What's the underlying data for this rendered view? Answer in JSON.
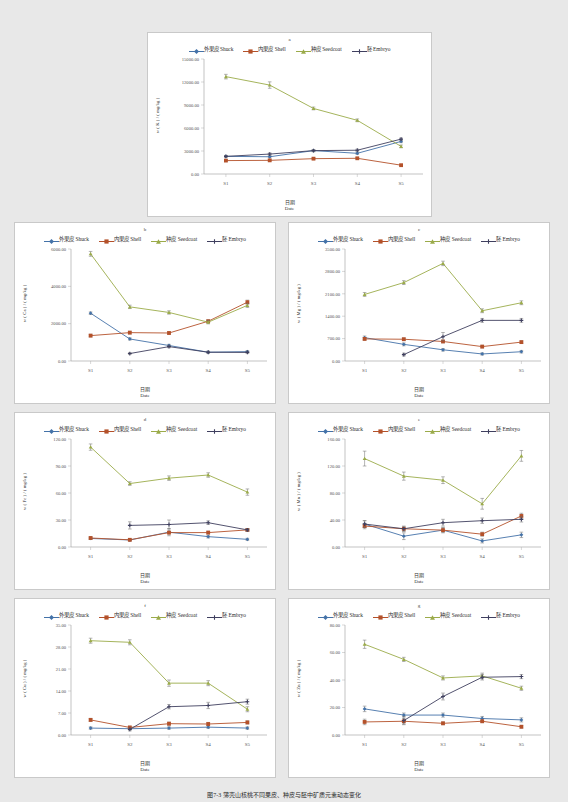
{
  "figure": {
    "caption": "图7-3  薄壳山核桃不同果皮、种皮与胚中矿质元素动态变化",
    "series_names": [
      "外果皮 Shuck",
      "内果皮 Shell",
      "种皮 Seedcoat",
      "胚 Embryo"
    ],
    "series_colors": [
      "#4472a8",
      "#b4512a",
      "#9bab4a",
      "#3f3f5f"
    ],
    "xlabel_cn": "日期",
    "xlabel_en": "Date",
    "categories": [
      "S1",
      "S2",
      "S3",
      "S4",
      "S5"
    ]
  },
  "chart_data": [
    {
      "id": "a",
      "panel": "a",
      "type": "line",
      "title": "a",
      "element": "K",
      "ylabel": "w ( K ) / ( mg/kg )",
      "xlabel": "日期 Date",
      "categories": [
        "S1",
        "S2",
        "S3",
        "S4",
        "S5"
      ],
      "ylim": [
        0,
        15000
      ],
      "yticks": [
        "0.00",
        "3000.00",
        "6000.00",
        "9000.00",
        "12000.00",
        "15000.00"
      ],
      "grid": false,
      "legend": "top",
      "series": [
        {
          "name": "外果皮 Shuck",
          "values": [
            2300,
            2250,
            3050,
            2700,
            4250
          ],
          "err": [
            120,
            130,
            140,
            150,
            160
          ]
        },
        {
          "name": "内果皮 Shell",
          "values": [
            1750,
            1780,
            2000,
            2050,
            1150
          ],
          "err": [
            90,
            90,
            90,
            90,
            90
          ]
        },
        {
          "name": "种皮 Seedcoat",
          "values": [
            12700,
            11600,
            8550,
            7000,
            3600
          ],
          "err": [
            300,
            420,
            180,
            180,
            180
          ]
        },
        {
          "name": "胚 Embryo",
          "values": [
            2300,
            2600,
            3050,
            3100,
            4550
          ],
          "err": [
            110,
            150,
            130,
            140,
            150
          ]
        }
      ]
    },
    {
      "id": "b",
      "panel": "b",
      "type": "line",
      "title": "b",
      "element": "Ca",
      "ylabel": "w ( Ca ) / ( mg/kg )",
      "xlabel": "日期 Date",
      "categories": [
        "S1",
        "S2",
        "S3",
        "S4",
        "S5"
      ],
      "ylim": [
        0,
        6000
      ],
      "yticks": [
        "0.00",
        "2000.00",
        "4000.00",
        "6000.00"
      ],
      "grid": false,
      "legend": "top",
      "series": [
        {
          "name": "外果皮 Shuck",
          "values": [
            2560,
            1180,
            830,
            470,
            500
          ],
          "err": [
            70,
            60,
            60,
            50,
            50
          ]
        },
        {
          "name": "内果皮 Shell",
          "values": [
            1360,
            1520,
            1500,
            2130,
            3150
          ],
          "err": [
            70,
            70,
            70,
            80,
            110
          ]
        },
        {
          "name": "种皮 Seedcoat",
          "values": [
            5740,
            2900,
            2600,
            2080,
            2980
          ],
          "err": [
            130,
            90,
            90,
            90,
            110
          ]
        },
        {
          "name": "胚 Embryo",
          "values": [
            null,
            400,
            770,
            470,
            460
          ],
          "err": [
            0,
            50,
            60,
            50,
            60
          ]
        }
      ]
    },
    {
      "id": "c",
      "panel": "c",
      "type": "line",
      "title": "c",
      "element": "Mg",
      "ylabel": "w ( Mg ) / ( mg/kg )",
      "xlabel": "日期 Date",
      "categories": [
        "S1",
        "S2",
        "S3",
        "S4",
        "S5"
      ],
      "ylim": [
        0,
        3500
      ],
      "yticks": [
        "0.00",
        "700.00",
        "1400.00",
        "2100.00",
        "2800.00",
        "3500.00"
      ],
      "grid": false,
      "legend": "top",
      "series": [
        {
          "name": "外果皮 Shuck",
          "values": [
            730,
            520,
            350,
            220,
            290
          ],
          "err": [
            50,
            45,
            40,
            35,
            40
          ]
        },
        {
          "name": "内果皮 Shell",
          "values": [
            690,
            680,
            610,
            450,
            590
          ],
          "err": [
            40,
            40,
            40,
            40,
            40
          ]
        },
        {
          "name": "种皮 Seedcoat",
          "values": [
            2080,
            2450,
            3050,
            1570,
            1820
          ],
          "err": [
            60,
            60,
            70,
            60,
            60
          ]
        },
        {
          "name": "胚 Embryo",
          "values": [
            null,
            200,
            760,
            1270,
            1270
          ],
          "err": [
            0,
            45,
            130,
            60,
            60
          ]
        }
      ]
    },
    {
      "id": "d",
      "panel": "d",
      "type": "line",
      "title": "d",
      "element": "Fe",
      "ylabel": "w ( Fe ) / ( mg/kg )",
      "xlabel": "日期 Date",
      "categories": [
        "S1",
        "S2",
        "S3",
        "S4",
        "S5"
      ],
      "ylim": [
        0,
        120
      ],
      "yticks": [
        "0.00",
        "30.00",
        "60.00",
        "90.00",
        "120.00"
      ],
      "grid": false,
      "legend": "top",
      "series": [
        {
          "name": "外果皮 Shuck",
          "values": [
            9.5,
            7.8,
            16.5,
            11.5,
            8.5
          ],
          "err": [
            1.2,
            1.0,
            4.0,
            1.5,
            1.2
          ]
        },
        {
          "name": "内果皮 Shell",
          "values": [
            10.0,
            8.0,
            16.0,
            16.0,
            19.0
          ],
          "err": [
            1.2,
            1.0,
            1.5,
            1.5,
            1.5
          ]
        },
        {
          "name": "种皮 Seedcoat",
          "values": [
            111,
            70.5,
            76.5,
            80.0,
            61.0
          ],
          "err": [
            3.5,
            2.0,
            2.5,
            2.5,
            3.5
          ]
        },
        {
          "name": "胚 Embryo",
          "values": [
            null,
            24.0,
            25.0,
            27.0,
            19.0
          ],
          "err": [
            0,
            4.0,
            5.0,
            2.0,
            1.5
          ]
        }
      ]
    },
    {
      "id": "e",
      "panel": "e",
      "type": "line",
      "title": "e",
      "element": "Mn",
      "ylabel": "w ( Mn ) / ( mg/kg )",
      "xlabel": "日期 Date",
      "categories": [
        "S1",
        "S2",
        "S3",
        "S4",
        "S5"
      ],
      "ylim": [
        0,
        160
      ],
      "yticks": [
        "0.00",
        "40.00",
        "80.00",
        "120.00",
        "160.00"
      ],
      "grid": false,
      "legend": "top",
      "series": [
        {
          "name": "外果皮 Shuck",
          "values": [
            34.0,
            16.0,
            25.0,
            9.0,
            18.0
          ],
          "err": [
            5.0,
            5.0,
            4.0,
            3.0,
            4.0
          ]
        },
        {
          "name": "内果皮 Shell",
          "values": [
            31.0,
            27.0,
            25.0,
            19.0,
            46.0
          ],
          "err": [
            4.0,
            3.0,
            3.0,
            3.0,
            4.0
          ]
        },
        {
          "name": "种皮 Seedcoat",
          "values": [
            131,
            105,
            99.0,
            64.0,
            135
          ],
          "err": [
            11,
            6,
            5,
            8,
            8
          ]
        },
        {
          "name": "胚 Embryo",
          "values": [
            34.0,
            27.0,
            36.0,
            39.0,
            41.0
          ],
          "err": [
            5.0,
            4.0,
            5.0,
            4.0,
            4.0
          ]
        }
      ]
    },
    {
      "id": "f",
      "panel": "f",
      "type": "line",
      "title": "f",
      "element": "Cu",
      "ylabel": "w ( Cu ) / ( mg/kg )",
      "xlabel": "日期 Date",
      "categories": [
        "S1",
        "S2",
        "S3",
        "S4",
        "S5"
      ],
      "ylim": [
        0,
        35
      ],
      "yticks": [
        "0.00",
        "7.00",
        "14.00",
        "21.00",
        "28.00",
        "35.00"
      ],
      "grid": false,
      "legend": "top",
      "series": [
        {
          "name": "外果皮 Shuck",
          "values": [
            2.2,
            2.0,
            2.2,
            2.5,
            2.2
          ],
          "err": [
            0.4,
            0.4,
            0.4,
            0.4,
            0.4
          ]
        },
        {
          "name": "内果皮 Shell",
          "values": [
            4.8,
            2.4,
            3.6,
            3.5,
            4.0
          ],
          "err": [
            0.5,
            0.4,
            0.5,
            0.5,
            0.5
          ]
        },
        {
          "name": "种皮 Seedcoat",
          "values": [
            30.0,
            29.5,
            16.5,
            16.5,
            8.2
          ],
          "err": [
            0.8,
            0.8,
            1.0,
            0.8,
            0.8
          ]
        },
        {
          "name": "胚 Embryo",
          "values": [
            null,
            1.8,
            9.0,
            9.4,
            10.6
          ],
          "err": [
            0,
            0.5,
            0.7,
            1.0,
            0.8
          ]
        }
      ]
    },
    {
      "id": "g",
      "panel": "g",
      "type": "line",
      "title": "g",
      "element": "Zn",
      "ylabel": "w ( Zn ) / ( mg/kg )",
      "xlabel": "日期 Date",
      "categories": [
        "S1",
        "S2",
        "S3",
        "S4",
        "S5"
      ],
      "ylim": [
        0,
        80
      ],
      "yticks": [
        "0.00",
        "20.00",
        "40.00",
        "60.00",
        "80.00"
      ],
      "grid": false,
      "legend": "top",
      "series": [
        {
          "name": "外果皮 Shuck",
          "values": [
            19.0,
            14.5,
            14.5,
            12.0,
            11.0
          ],
          "err": [
            2.0,
            1.5,
            1.5,
            1.5,
            1.5
          ]
        },
        {
          "name": "内果皮 Shell",
          "values": [
            9.5,
            10.0,
            8.5,
            10.0,
            6.0
          ],
          "err": [
            2.0,
            2.0,
            1.0,
            1.0,
            1.0
          ]
        },
        {
          "name": "种皮 Seedcoat",
          "values": [
            66.0,
            55.0,
            41.5,
            43.0,
            34.0
          ],
          "err": [
            3.0,
            1.5,
            1.5,
            2.0,
            1.5
          ]
        },
        {
          "name": "胚 Embryo",
          "values": [
            null,
            10.5,
            28.0,
            42.0,
            42.5
          ],
          "err": [
            0,
            3.0,
            2.5,
            2.0,
            1.5
          ]
        }
      ]
    }
  ]
}
